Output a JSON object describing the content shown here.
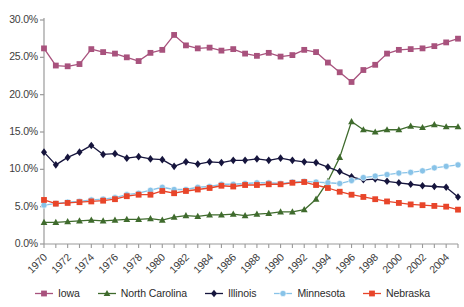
{
  "chart_data": {
    "type": "line",
    "title": "",
    "xlabel": "",
    "ylabel": "",
    "ylim": [
      0,
      30
    ],
    "ytick_labels": [
      "0.0%",
      "5.0%",
      "10.0%",
      "15.0%",
      "20.0%",
      "25.0%",
      "30.0%"
    ],
    "ytick_values": [
      0,
      5,
      10,
      15,
      20,
      25,
      30
    ],
    "grid": false,
    "legend_position": "bottom",
    "x": [
      1970,
      1971,
      1972,
      1973,
      1974,
      1975,
      1976,
      1977,
      1978,
      1979,
      1980,
      1981,
      1982,
      1983,
      1984,
      1985,
      1986,
      1987,
      1988,
      1989,
      1990,
      1991,
      1992,
      1993,
      1994,
      1995,
      1996,
      1997,
      1998,
      1999,
      2000,
      2001,
      2002,
      2003,
      2004,
      2005
    ],
    "xtick_labels": [
      "1970",
      "1972",
      "1974",
      "1976",
      "1978",
      "1980",
      "1982",
      "1984",
      "1986",
      "1988",
      "1990",
      "1992",
      "1994",
      "1996",
      "1998",
      "2000",
      "2002",
      "2004"
    ],
    "xtick_values": [
      1970,
      1972,
      1974,
      1976,
      1978,
      1980,
      1982,
      1984,
      1986,
      1988,
      1990,
      1992,
      1994,
      1996,
      1998,
      2000,
      2002,
      2004
    ],
    "series": [
      {
        "name": "Iowa",
        "color": "#a8527d",
        "marker": "square",
        "values": [
          26.2,
          23.9,
          23.8,
          24.1,
          26.1,
          25.7,
          25.5,
          25.0,
          24.5,
          25.6,
          26.0,
          28.0,
          26.6,
          26.2,
          26.3,
          25.9,
          26.1,
          25.5,
          25.2,
          25.6,
          25.1,
          25.3,
          26.0,
          25.7,
          24.3,
          23.0,
          21.7,
          23.3,
          24.0,
          25.5,
          26.0,
          26.1,
          26.2,
          26.5,
          27.0,
          27.5
        ]
      },
      {
        "name": "North Carolina",
        "color": "#3f6b2d",
        "marker": "triangle",
        "values": [
          2.9,
          2.9,
          3.0,
          3.1,
          3.2,
          3.1,
          3.2,
          3.3,
          3.3,
          3.4,
          3.2,
          3.6,
          3.8,
          3.7,
          3.9,
          3.9,
          4.0,
          3.8,
          4.0,
          4.1,
          4.3,
          4.3,
          4.6,
          6.0,
          8.4,
          11.6,
          16.4,
          15.3,
          15.0,
          15.3,
          15.3,
          15.8,
          15.6,
          16.0,
          15.7,
          15.7
        ]
      },
      {
        "name": "Illinois",
        "color": "#16153d",
        "marker": "diamond",
        "values": [
          12.3,
          10.6,
          11.6,
          12.3,
          13.2,
          12.0,
          12.1,
          11.5,
          11.7,
          11.4,
          11.3,
          10.4,
          11.0,
          10.7,
          11.0,
          10.9,
          11.2,
          11.2,
          11.4,
          11.2,
          11.5,
          11.2,
          11.0,
          10.9,
          10.3,
          9.7,
          9.0,
          8.6,
          8.7,
          8.4,
          8.2,
          8.0,
          7.8,
          7.7,
          7.6,
          6.3
        ]
      },
      {
        "name": "Minnesota",
        "color": "#88c3e8",
        "marker": "circle",
        "values": [
          5.2,
          5.4,
          5.6,
          5.7,
          5.9,
          6.0,
          6.2,
          6.6,
          6.8,
          7.2,
          7.6,
          7.3,
          7.3,
          7.6,
          7.7,
          8.0,
          8.0,
          8.1,
          8.2,
          8.2,
          8.1,
          8.3,
          8.4,
          8.3,
          8.2,
          8.1,
          8.5,
          8.9,
          9.1,
          9.3,
          9.5,
          9.6,
          9.8,
          10.2,
          10.4,
          10.6
        ]
      },
      {
        "name": "Nebraska",
        "color": "#e8452a",
        "marker": "square",
        "values": [
          5.9,
          5.4,
          5.5,
          5.6,
          5.7,
          5.8,
          6.0,
          6.4,
          6.6,
          6.6,
          7.1,
          6.8,
          7.1,
          7.3,
          7.5,
          7.8,
          7.7,
          7.9,
          7.9,
          8.0,
          8.0,
          8.2,
          8.3,
          7.9,
          7.5,
          7.0,
          6.6,
          6.3,
          6.0,
          5.7,
          5.5,
          5.3,
          5.2,
          5.1,
          5.0,
          4.6
        ]
      }
    ]
  }
}
